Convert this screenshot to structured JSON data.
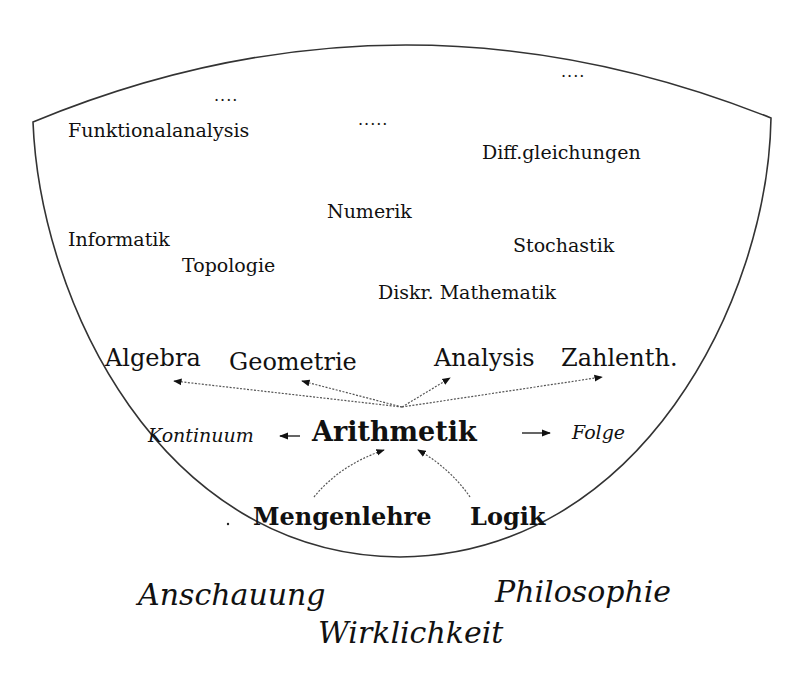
{
  "diagram": {
    "upper_fields": [
      {
        "id": "funktionalanalysis",
        "label": "Funktionalanalysis"
      },
      {
        "id": "diffgleichungen",
        "label": "Diff.gleichungen"
      },
      {
        "id": "numerik",
        "label": "Numerik"
      },
      {
        "id": "informatik",
        "label": "Informatik"
      },
      {
        "id": "topologie",
        "label": "Topologie"
      },
      {
        "id": "stochastik",
        "label": "Stochastik"
      },
      {
        "id": "diskr-mathematik",
        "label": "Diskr. Mathematik"
      }
    ],
    "ellipses": [
      "....",
      ".....",
      "...."
    ],
    "core_fields": [
      {
        "id": "algebra",
        "label": "Algebra"
      },
      {
        "id": "geometrie",
        "label": "Geometrie"
      },
      {
        "id": "analysis",
        "label": "Analysis"
      },
      {
        "id": "zahlentheorie",
        "label": "Zahlenth."
      }
    ],
    "center": {
      "label": "Arithmetik"
    },
    "side_concepts": {
      "left": "Kontinuum",
      "right": "Folge"
    },
    "foundations": [
      {
        "id": "mengenlehre",
        "label": "Mengenlehre"
      },
      {
        "id": "logik",
        "label": "Logik"
      }
    ],
    "outside": [
      {
        "id": "anschauung",
        "label": "Anschauung"
      },
      {
        "id": "philosophie",
        "label": "Philosophie"
      },
      {
        "id": "wirklichkeit",
        "label": "Wirklichkeit"
      }
    ],
    "edges": [
      {
        "from": "Arithmetik",
        "to": "Algebra",
        "style": "dotted"
      },
      {
        "from": "Arithmetik",
        "to": "Geometrie",
        "style": "dotted"
      },
      {
        "from": "Arithmetik",
        "to": "Analysis",
        "style": "dotted"
      },
      {
        "from": "Arithmetik",
        "to": "Zahlenth.",
        "style": "dotted"
      },
      {
        "from": "Arithmetik",
        "to": "Kontinuum",
        "style": "solid"
      },
      {
        "from": "Arithmetik",
        "to": "Folge",
        "style": "solid"
      },
      {
        "from": "Mengenlehre",
        "to": "Arithmetik",
        "style": "dotted"
      },
      {
        "from": "Logik",
        "to": "Arithmetik",
        "style": "dotted"
      }
    ]
  }
}
